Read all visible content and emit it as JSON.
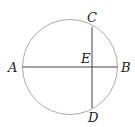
{
  "diagram": {
    "type": "circle-chords",
    "circle": {
      "cx": 70,
      "cy": 67,
      "r": 47.5,
      "stroke": "#aaaaaa"
    },
    "chords": [
      {
        "name": "AB",
        "x1": 22.5,
        "y1": 67,
        "x2": 117.5,
        "y2": 67,
        "stroke": "#444444"
      },
      {
        "name": "CD",
        "x1": 92,
        "y1": 27,
        "x2": 92,
        "y2": 108,
        "stroke": "#444444"
      }
    ],
    "labels": {
      "A": "A",
      "B": "B",
      "C": "C",
      "D": "D",
      "E": "E"
    }
  }
}
